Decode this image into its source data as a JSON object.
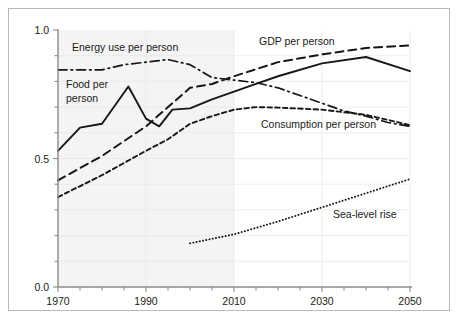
{
  "figure": {
    "background_color": "#ffffff",
    "frame_color": "#b9b9b9",
    "line_color": "#171717",
    "axis_color": "#8d8d8d",
    "shaded_region_color": "#f4f4f4"
  },
  "axes": {
    "y_tick_labels": [
      "1.0",
      "0.5",
      "0.0"
    ],
    "y_tick_values": [
      1.0,
      0.5,
      0.0
    ],
    "y_minor_tick_values": [
      0.1,
      0.2,
      0.3,
      0.4,
      0.6,
      0.7,
      0.8,
      0.9
    ],
    "x_tick_labels": [
      "1970",
      "1990",
      "2010",
      "2030",
      "2050"
    ],
    "x_tick_values": [
      1970,
      1990,
      2010,
      2030,
      2050
    ],
    "x_minor_tick_values": [
      1975,
      1980,
      1985,
      1995,
      2000,
      2005,
      2015,
      2020,
      2025,
      2035,
      2040,
      2045
    ]
  },
  "annotations": {
    "energy_label": "Energy use per person",
    "food_label_line1": "Food per",
    "food_label_line2": "person",
    "gdp_label": "GDP per person",
    "consumption_label": "Consumption per person",
    "sealevel_label": "Sea-level rise"
  },
  "chart_data": {
    "type": "line",
    "title": "",
    "xlabel": "",
    "ylabel": "",
    "xlim": [
      1970,
      2050
    ],
    "ylim": [
      0.0,
      1.0
    ],
    "grid": true,
    "legend_position": "inline-annotations",
    "shaded_region": {
      "x_start": 1970,
      "x_end": 2010,
      "note": "historical period shading"
    },
    "series": [
      {
        "name": "Energy use per person",
        "style": "dash-dot",
        "x": [
          1970,
          1975,
          1980,
          1985,
          1990,
          1995,
          2000,
          2005,
          2010,
          2015,
          2020,
          2025,
          2030,
          2035,
          2040,
          2045,
          2050
        ],
        "y": [
          0.845,
          0.845,
          0.845,
          0.865,
          0.875,
          0.885,
          0.865,
          0.815,
          0.805,
          0.795,
          0.775,
          0.745,
          0.715,
          0.685,
          0.665,
          0.64,
          0.625
        ]
      },
      {
        "name": "Food per person",
        "style": "solid",
        "x": [
          1970,
          1975,
          1980,
          1986,
          1990,
          1993,
          1996,
          2000,
          2005,
          2010,
          2015,
          2020,
          2030,
          2040,
          2050
        ],
        "y": [
          0.53,
          0.62,
          0.635,
          0.78,
          0.655,
          0.625,
          0.69,
          0.695,
          0.73,
          0.76,
          0.79,
          0.82,
          0.87,
          0.895,
          0.84
        ]
      },
      {
        "name": "GDP per person",
        "style": "long-dash",
        "x": [
          1970,
          1980,
          1990,
          1995,
          2000,
          2005,
          2010,
          2020,
          2030,
          2040,
          2050
        ],
        "y": [
          0.415,
          0.51,
          0.625,
          0.7,
          0.775,
          0.79,
          0.82,
          0.875,
          0.905,
          0.93,
          0.94
        ]
      },
      {
        "name": "Consumption per person",
        "style": "short-dash",
        "x": [
          1970,
          1980,
          1990,
          1995,
          2000,
          2005,
          2010,
          2015,
          2020,
          2030,
          2040,
          2050
        ],
        "y": [
          0.35,
          0.435,
          0.53,
          0.575,
          0.635,
          0.665,
          0.69,
          0.7,
          0.698,
          0.69,
          0.67,
          0.63
        ]
      },
      {
        "name": "Sea-level rise",
        "style": "dotted",
        "x": [
          2000,
          2010,
          2020,
          2030,
          2040,
          2050
        ],
        "y": [
          0.17,
          0.205,
          0.255,
          0.31,
          0.365,
          0.42
        ]
      }
    ]
  }
}
